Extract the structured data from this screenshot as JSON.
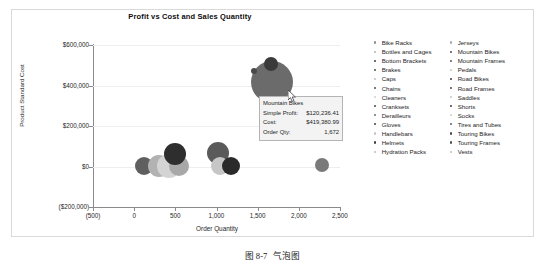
{
  "chart_data": {
    "type": "scatter",
    "title": "Profit vs Cost and Sales Quantity",
    "xlabel": "Order Quantity",
    "ylabel": "Product Standard Cost",
    "xlim": [
      -500,
      2500
    ],
    "ylim": [
      -200000,
      600000
    ],
    "xticks": [
      "(500)",
      "0",
      "500",
      "1,000",
      "1,500",
      "2,000",
      "2,500"
    ],
    "xtick_values": [
      -500,
      0,
      500,
      1000,
      1500,
      2000,
      2500
    ],
    "yticks": [
      "$600,000",
      "$400,000",
      "$200,000",
      "$0",
      "($200,000)"
    ],
    "ytick_values": [
      600000,
      400000,
      200000,
      0,
      -200000
    ],
    "grid": true,
    "legend_position": "right",
    "size_encoding": "Simple Profit",
    "points": [
      {
        "label": "Bike Racks",
        "x": 118,
        "y": 2000,
        "size": 9,
        "color": "#5f5f5f"
      },
      {
        "label": "Bottles and Cages",
        "x": 300,
        "y": 1500,
        "size": 11,
        "color": "#b2b2b2"
      },
      {
        "label": "Bottom Brackets",
        "x": 420,
        "y": 2000,
        "size": 12,
        "color": "#d4d4d4"
      },
      {
        "label": "Brakes",
        "x": 540,
        "y": 2500,
        "size": 10,
        "color": "#a8a8a8"
      },
      {
        "label": "Caps",
        "x": 500,
        "y": 62000,
        "size": 11,
        "color": "#2e2e2e"
      },
      {
        "label": "Chains",
        "x": 1015,
        "y": 68000,
        "size": 11,
        "color": "#5a5a5a"
      },
      {
        "label": "Cleaners",
        "x": 1040,
        "y": 1500,
        "size": 9,
        "color": "#c6c6c6"
      },
      {
        "label": "Cranksets",
        "x": 1180,
        "y": 1800,
        "size": 9,
        "color": "#2a2a2a"
      },
      {
        "label": "Derailleurs",
        "x": 2285,
        "y": 6000,
        "size": 7,
        "color": "#7a7a7a"
      },
      {
        "label": "Mountain Bikes",
        "x": 1672,
        "y": 419381,
        "size": 21,
        "color": "#6b6b6b"
      },
      {
        "label": "Road Bikes",
        "x": 1660,
        "y": 505000,
        "size": 7,
        "color": "#3a3a3a"
      },
      {
        "label": "Touring Bikes",
        "x": 1460,
        "y": 470000,
        "size": 3,
        "color": "#4a4a4a"
      }
    ]
  },
  "tooltip": {
    "title": "Mountain Bikes",
    "rows": [
      {
        "key": "Simple Profit:",
        "value": "$120,236.41"
      },
      {
        "key": "Cost:",
        "value": "$419,380.99"
      },
      {
        "key": "Order Qty:",
        "value": "1,672"
      }
    ]
  },
  "legend": {
    "columns": [
      [
        {
          "label": "Bike Racks",
          "color": "#8c8c8c"
        },
        {
          "label": "Bottles and Cages",
          "color": "#b5b5b5"
        },
        {
          "label": "Bottom Brackets",
          "color": "#3d3d3d"
        },
        {
          "label": "Brakes",
          "color": "#4a4a4a"
        },
        {
          "label": "Caps",
          "color": "#c0c0c0"
        },
        {
          "label": "Chains",
          "color": "#4f4f4f"
        },
        {
          "label": "Cleaners",
          "color": "#cfcfcf"
        },
        {
          "label": "Cranksets",
          "color": "#474747"
        },
        {
          "label": "Derailleurs",
          "color": "#6e6e6e"
        },
        {
          "label": "Gloves",
          "color": "#3f3f3f"
        },
        {
          "label": "Handlebars",
          "color": "#c4c4c4"
        },
        {
          "label": "Helmets",
          "color": "#414141"
        },
        {
          "label": "Hydration Packs",
          "color": "#bdbdbd"
        }
      ],
      [
        {
          "label": "Jerseys",
          "color": "#a8a8a8"
        },
        {
          "label": "Mountain Bikes",
          "color": "#4c4c4c"
        },
        {
          "label": "Mountain Frames",
          "color": "#585858"
        },
        {
          "label": "Pedals",
          "color": "#c9c9c9"
        },
        {
          "label": "Road Bikes",
          "color": "#3b3b3b"
        },
        {
          "label": "Road Frames",
          "color": "#454545"
        },
        {
          "label": "Saddles",
          "color": "#c2c2c2"
        },
        {
          "label": "Shorts",
          "color": "#3e3e3e"
        },
        {
          "label": "Socks",
          "color": "#cccccc"
        },
        {
          "label": "Tires and Tubes",
          "color": "#5c5c5c"
        },
        {
          "label": "Touring Bikes",
          "color": "#4e4e4e"
        },
        {
          "label": "Touring Frames",
          "color": "#505050"
        },
        {
          "label": "Vests",
          "color": "#bfbfbf"
        }
      ]
    ]
  },
  "caption": {
    "label": "图 8-7",
    "text": "气泡图"
  },
  "colors": {
    "axis": "#8a8a8a",
    "grid": "#eeeeee",
    "frame": "#d9d9d9",
    "tooltip_bg": "#f3f3f3",
    "tooltip_border": "#b4b4b4",
    "text": "#1c1c1c"
  }
}
